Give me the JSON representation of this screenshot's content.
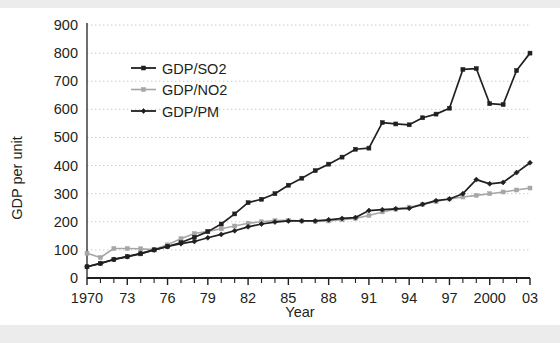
{
  "figure": {
    "background": "#ffffff",
    "top_band_color": "#ececed",
    "bottom_band_color": "#ececec"
  },
  "chart_data": {
    "type": "line",
    "title": "",
    "xlabel": "Year",
    "ylabel": "GDP per unit",
    "xlim": [
      1970,
      2003
    ],
    "ylim": [
      0,
      900
    ],
    "yticks": [
      0,
      100,
      200,
      300,
      400,
      500,
      600,
      700,
      800,
      900
    ],
    "ytick_labels": [
      "0",
      "100",
      "200",
      "300",
      "400",
      "500",
      "600",
      "700",
      "800",
      "900"
    ],
    "xticks": [
      1970,
      1973,
      1976,
      1979,
      1982,
      1985,
      1988,
      1991,
      1994,
      1997,
      2000,
      2003
    ],
    "xtick_labels": [
      "1970",
      "73",
      "76",
      "79",
      "82",
      "85",
      "88",
      "91",
      "94",
      "97",
      "2000",
      "03"
    ],
    "minor_xticks_every": 1,
    "grid": "horizontal-dotted",
    "legend_position": "upper-left-inside",
    "x": [
      1970,
      1971,
      1972,
      1973,
      1974,
      1975,
      1976,
      1977,
      1978,
      1979,
      1980,
      1981,
      1982,
      1983,
      1984,
      1985,
      1986,
      1987,
      1988,
      1989,
      1990,
      1991,
      1992,
      1993,
      1994,
      1995,
      1996,
      1997,
      1998,
      1999,
      2000,
      2001,
      2002,
      2003
    ],
    "series": [
      {
        "name": "GDP/SO2",
        "color": "#231f20",
        "marker": "square",
        "values": [
          40,
          52,
          66,
          76,
          86,
          100,
          112,
          126,
          145,
          165,
          192,
          228,
          268,
          280,
          300,
          330,
          355,
          382,
          405,
          430,
          458,
          462,
          553,
          548,
          545,
          570,
          583,
          604,
          742,
          745,
          620,
          617,
          738,
          800
        ]
      },
      {
        "name": "GDP/NO2",
        "color": "#a6a6a6",
        "marker": "square",
        "values": [
          88,
          73,
          105,
          105,
          104,
          101,
          118,
          140,
          158,
          166,
          175,
          185,
          195,
          200,
          204,
          205,
          203,
          202,
          203,
          207,
          212,
          222,
          235,
          245,
          252,
          262,
          272,
          281,
          288,
          294,
          300,
          306,
          313,
          320
        ]
      },
      {
        "name": "GDP/PM",
        "color": "#231f20",
        "marker": "diamond",
        "values": [
          40,
          52,
          66,
          76,
          88,
          100,
          112,
          122,
          130,
          143,
          155,
          168,
          182,
          192,
          199,
          203,
          203,
          203,
          207,
          212,
          215,
          240,
          243,
          246,
          248,
          262,
          275,
          281,
          300,
          350,
          335,
          340,
          375,
          410
        ]
      }
    ]
  },
  "legend": {
    "items": [
      {
        "label": "GDP/SO2"
      },
      {
        "label": "GDP/NO2"
      },
      {
        "label": "GDP/PM"
      }
    ]
  }
}
